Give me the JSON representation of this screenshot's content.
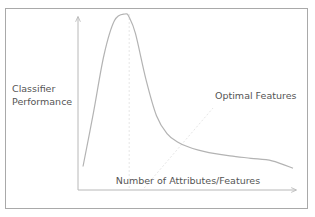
{
  "chart_data": {
    "type": "line",
    "title": "",
    "xlabel": "Number of Attributes/Features",
    "ylabel": "Classifier Performance",
    "ylabel_lines": [
      "Classifier",
      "Performance"
    ],
    "annotation": "Optimal Features",
    "x_ticks": [],
    "y_ticks": [],
    "grid": false,
    "legend": "none",
    "xlim": [
      0,
      100
    ],
    "ylim": [
      0,
      100
    ],
    "series": [
      {
        "name": "Classifier Performance",
        "x": [
          0,
          5,
          10,
          15,
          20,
          22,
          25,
          30,
          35,
          40,
          45,
          50,
          55,
          60,
          70,
          80,
          90,
          100
        ],
        "y": [
          7,
          40,
          75,
          96,
          100,
          98,
          88,
          60,
          38,
          27,
          22,
          19,
          17,
          15.5,
          13.5,
          12,
          10.5,
          6
        ]
      }
    ],
    "optimal_x": 22,
    "colors": {
      "curve": "#b3b3b3",
      "axes": "#b8b8b8",
      "frame": "#a9a9a9",
      "guide": "#e6e6e6",
      "text": "#555555"
    }
  }
}
